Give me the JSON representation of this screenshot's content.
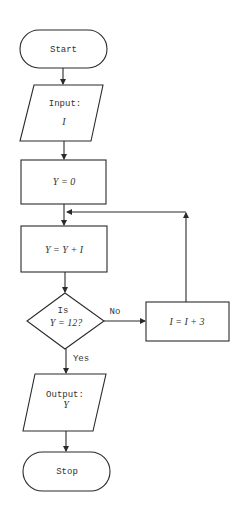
{
  "diagram": {
    "type": "flowchart",
    "nodes": {
      "start": {
        "shape": "terminator",
        "label": "Start"
      },
      "input": {
        "shape": "io",
        "label": "Input:",
        "var": "I"
      },
      "init": {
        "shape": "process",
        "label": "Y = 0"
      },
      "accumulate": {
        "shape": "process",
        "label": "Y = Y + I"
      },
      "decision": {
        "shape": "decision",
        "line1": "Is",
        "line2": "Y = 12?"
      },
      "increment": {
        "shape": "process",
        "label": "I = I + 3"
      },
      "output": {
        "shape": "io",
        "label": "Output:",
        "var": "Y"
      },
      "stop": {
        "shape": "terminator",
        "label": "Stop"
      }
    },
    "edges": {
      "no_label": "No",
      "yes_label": "Yes"
    },
    "colors": {
      "stroke": "#2a2a2a",
      "text": "#333333",
      "background": "#ffffff"
    }
  }
}
